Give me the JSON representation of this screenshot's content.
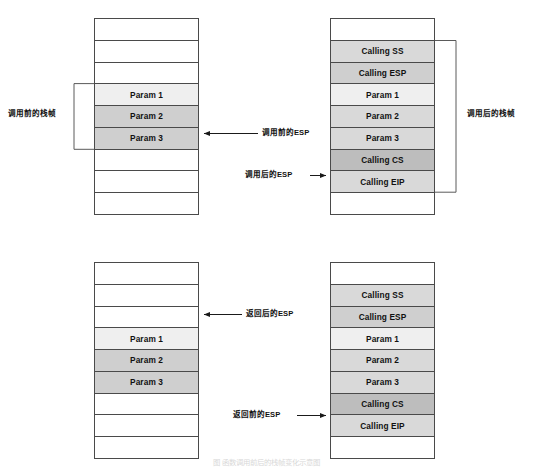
{
  "diagram": {
    "title_caption": "图 函数调用前后的栈帧变化示意图",
    "colors": {
      "stroke": "#4a4a4a",
      "text": "#111111",
      "shade_none": "#ffffff",
      "shade_l1": "#efefef",
      "shade_l2": "#d9d9d9",
      "shade_l3": "#cfcfcf",
      "shade_l4": "#bdbdbd"
    }
  },
  "top_section": {
    "left_stack": {
      "name": "调用前的栈",
      "cells": [
        {
          "label": "",
          "shade": "none"
        },
        {
          "label": "",
          "shade": "none"
        },
        {
          "label": "",
          "shade": "none"
        },
        {
          "label": "Param 1",
          "shade": "l1"
        },
        {
          "label": "Param 2",
          "shade": "l3"
        },
        {
          "label": "Param 3",
          "shade": "l3"
        },
        {
          "label": "",
          "shade": "none"
        },
        {
          "label": "",
          "shade": "none"
        },
        {
          "label": "",
          "shade": "none"
        }
      ]
    },
    "right_stack": {
      "name": "调用后的栈",
      "cells": [
        {
          "label": "",
          "shade": "none"
        },
        {
          "label": "Calling SS",
          "shade": "l2"
        },
        {
          "label": "Calling ESP",
          "shade": "l3"
        },
        {
          "label": "Param 1",
          "shade": "l1"
        },
        {
          "label": "Param 2",
          "shade": "l2"
        },
        {
          "label": "Param 3",
          "shade": "l2"
        },
        {
          "label": "Calling CS",
          "shade": "l4"
        },
        {
          "label": "Calling EIP",
          "shade": "l2"
        },
        {
          "label": "",
          "shade": "none"
        }
      ]
    },
    "left_bracket_label": "调用前的栈帧",
    "right_bracket_label": "调用后的栈帧",
    "esp_before_label": "调用前的ESP",
    "esp_after_label": "调用后的ESP"
  },
  "bottom_section": {
    "left_stack": {
      "name": "返回后的栈",
      "cells": [
        {
          "label": "",
          "shade": "none"
        },
        {
          "label": "",
          "shade": "none"
        },
        {
          "label": "",
          "shade": "none"
        },
        {
          "label": "Param 1",
          "shade": "l1"
        },
        {
          "label": "Param 2",
          "shade": "l3"
        },
        {
          "label": "Param 3",
          "shade": "l3"
        },
        {
          "label": "",
          "shade": "none"
        },
        {
          "label": "",
          "shade": "none"
        },
        {
          "label": "",
          "shade": "none"
        }
      ]
    },
    "right_stack": {
      "name": "返回前的栈",
      "cells": [
        {
          "label": "",
          "shade": "none"
        },
        {
          "label": "Calling SS",
          "shade": "l2"
        },
        {
          "label": "Calling ESP",
          "shade": "l3"
        },
        {
          "label": "Param 1",
          "shade": "l1"
        },
        {
          "label": "Param 2",
          "shade": "l2"
        },
        {
          "label": "Param 3",
          "shade": "l2"
        },
        {
          "label": "Calling CS",
          "shade": "l4"
        },
        {
          "label": "Calling EIP",
          "shade": "l2"
        },
        {
          "label": "",
          "shade": "none"
        }
      ]
    },
    "esp_after_return_label": "返回后的ESP",
    "esp_before_return_label": "返回前的ESP"
  }
}
